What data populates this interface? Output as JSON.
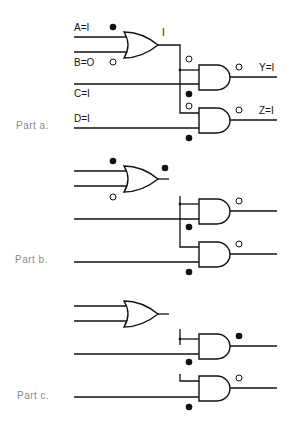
{
  "diagram": {
    "type": "logic-circuit",
    "parts": [
      {
        "label": "Part a.",
        "inputs": [
          {
            "name": "A",
            "text": "A=I",
            "value": 1
          },
          {
            "name": "B",
            "text": "B=O",
            "value": 0
          },
          {
            "name": "C",
            "text": "C=I",
            "value": 1
          },
          {
            "name": "D",
            "text": "D=I",
            "value": 1
          }
        ],
        "or_output_text": "I",
        "outputs": [
          {
            "name": "Y",
            "text": "Y=I",
            "value": 1
          },
          {
            "name": "Z",
            "text": "Z=I",
            "value": 1
          }
        ]
      },
      {
        "label": "Part b."
      },
      {
        "label": "Part c."
      }
    ],
    "legend": {
      "filled_dot": "logic 1 marker",
      "hollow_dot": "logic 0 marker"
    }
  }
}
